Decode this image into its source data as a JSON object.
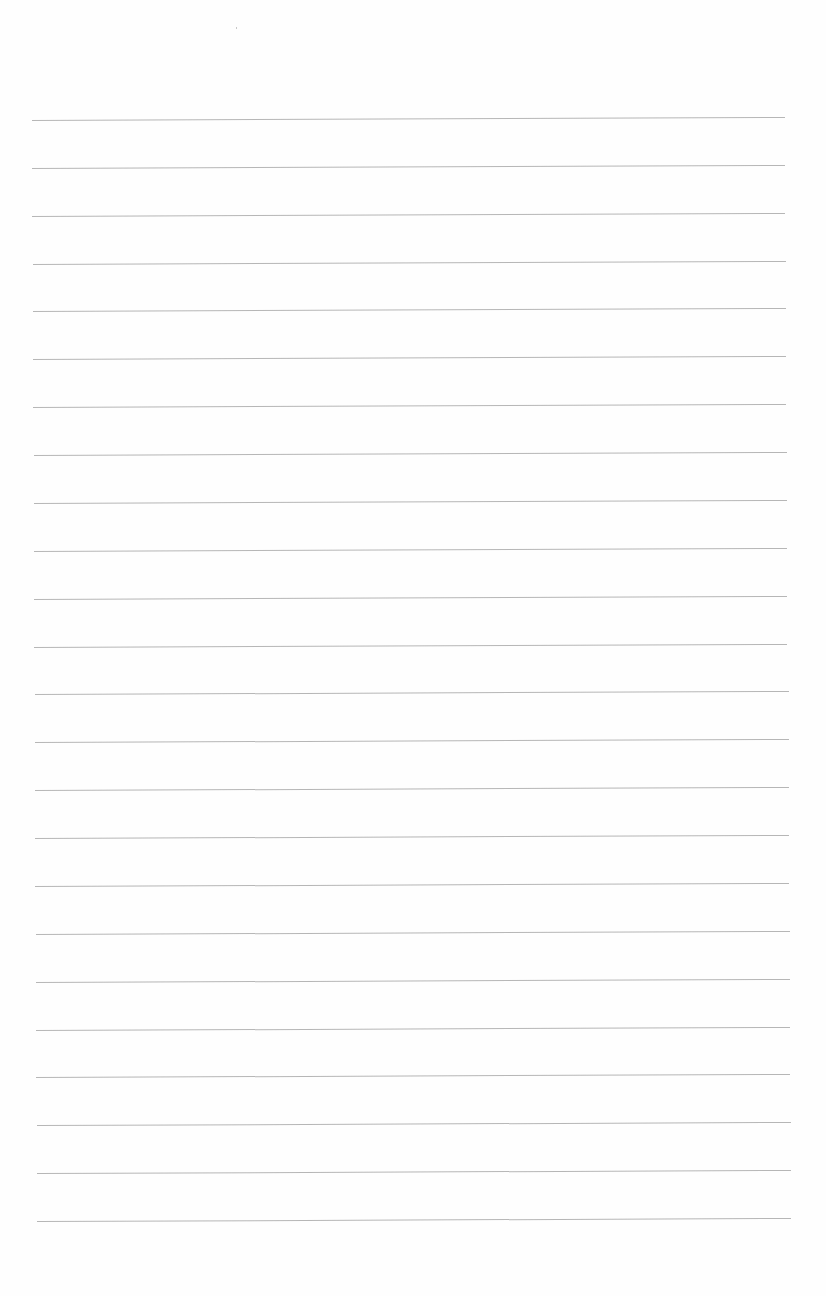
{
  "page": {
    "type": "lined-paper",
    "background_color": "#fefefe",
    "line_color": "#a9a9a9",
    "line_count": 24,
    "first_line_y": 120,
    "line_spacing": 47.87,
    "left_x_top": 32,
    "left_x_bottom": 37,
    "right_x_top": 785,
    "right_x_bottom": 791,
    "skew_px": -3
  }
}
